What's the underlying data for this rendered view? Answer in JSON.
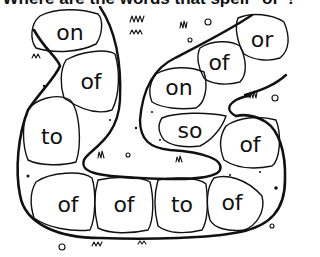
{
  "heading": {
    "text": "Where are the words that spell \"of\"?"
  },
  "path": {
    "description": "stone path illustration",
    "stones": [
      {
        "id": "s1",
        "word": "on",
        "x": 70,
        "y": 33
      },
      {
        "id": "s2",
        "word": "of",
        "x": 91,
        "y": 82
      },
      {
        "id": "s3",
        "word": "to",
        "x": 52,
        "y": 137
      },
      {
        "id": "s4",
        "word": "of",
        "x": 68,
        "y": 205
      },
      {
        "id": "s5",
        "word": "of",
        "x": 124,
        "y": 205
      },
      {
        "id": "s6",
        "word": "to",
        "x": 182,
        "y": 205
      },
      {
        "id": "s7",
        "word": "of",
        "x": 232,
        "y": 203
      },
      {
        "id": "s8",
        "word": "of",
        "x": 250,
        "y": 145
      },
      {
        "id": "s9",
        "word": "so",
        "x": 190,
        "y": 131
      },
      {
        "id": "s10",
        "word": "on",
        "x": 179,
        "y": 88
      },
      {
        "id": "s11",
        "word": "of",
        "x": 219,
        "y": 63
      },
      {
        "id": "s12",
        "word": "or",
        "x": 262,
        "y": 40
      }
    ]
  },
  "colors": {
    "ink": "#111111",
    "background": "#ffffff"
  }
}
